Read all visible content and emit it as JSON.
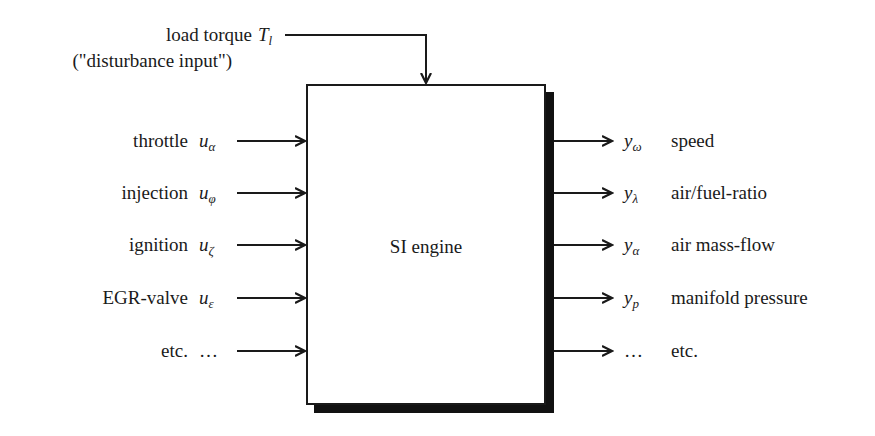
{
  "disturbance": {
    "label_line1": "load torque",
    "symbol": "T",
    "symbol_sub": "l",
    "label_line2": "(\"disturbance input\")"
  },
  "block": {
    "label": "SI engine"
  },
  "inputs": [
    {
      "label": "throttle",
      "symbol": "u",
      "sub": "α"
    },
    {
      "label": "injection",
      "symbol": "u",
      "sub": "φ"
    },
    {
      "label": "ignition",
      "symbol": "u",
      "sub": "ζ"
    },
    {
      "label": "EGR-valve",
      "symbol": "u",
      "sub": "ε"
    },
    {
      "label": "etc.",
      "symbol": "…",
      "sub": ""
    }
  ],
  "outputs": [
    {
      "symbol": "y",
      "sub": "ω",
      "label": "speed"
    },
    {
      "symbol": "y",
      "sub": "λ",
      "label": "air/fuel-ratio"
    },
    {
      "symbol": "y",
      "sub": "α",
      "label": "air mass-flow"
    },
    {
      "symbol": "y",
      "sub": "p",
      "label": "manifold pressure"
    },
    {
      "symbol": "…",
      "sub": "",
      "label": "etc."
    }
  ],
  "colors": {
    "line": "#1a1a1a",
    "background": "#ffffff"
  }
}
